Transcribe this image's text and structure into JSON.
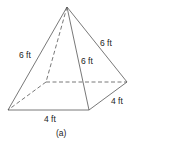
{
  "figure": {
    "caption": "(a)",
    "shape": "square pyramid",
    "labels": {
      "slant_left": "6 ft",
      "slant_right": "6 ft",
      "slant_front": "6 ft",
      "base_front": "4 ft",
      "base_side": "4 ft"
    },
    "colors": {
      "line": "#555555",
      "text": "#222222"
    }
  }
}
